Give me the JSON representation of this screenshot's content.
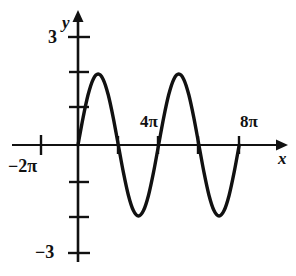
{
  "figure": {
    "type": "math-graph",
    "background": "#ffffff",
    "ink_color": "#111111"
  },
  "labels": {
    "y_axis": "y",
    "x_axis": "x",
    "y_top": "3",
    "y_bottom": "−3",
    "x_left": "−2π",
    "x_mid": "4π",
    "x_right": "8π"
  },
  "chart_data": {
    "type": "line",
    "title": "",
    "xlabel": "x",
    "ylabel": "y",
    "function": "y = 2 sin(x/2)",
    "amplitude": 2,
    "period": "4π",
    "grid": false,
    "legend": null,
    "xlim": [
      "−2π",
      "9π"
    ],
    "ylim": [
      -3,
      3
    ],
    "y_ticks": [
      3,
      2,
      1,
      0,
      -1,
      -2,
      -3
    ],
    "y_tick_labels": [
      "3",
      "",
      "",
      "",
      "",
      "",
      "−3"
    ],
    "x_ticks": [
      "−2π",
      "0",
      "2π",
      "4π",
      "6π",
      "8π"
    ],
    "x_tick_labels": [
      "−2π",
      "",
      "",
      "4π",
      "",
      "8π"
    ],
    "domain_drawn": [
      "0",
      "8π"
    ],
    "zero_crossings": [
      "0",
      "2π",
      "4π",
      "6π",
      "8π"
    ],
    "maxima": [
      {
        "x": "π",
        "y": 2
      },
      {
        "x": "5π",
        "y": 2
      }
    ],
    "minima": [
      {
        "x": "3π",
        "y": -2
      },
      {
        "x": "7π",
        "y": -2
      }
    ],
    "x": [
      0.0,
      0.25,
      0.5,
      0.75,
      1.0,
      1.25,
      1.5,
      1.75,
      2.0,
      2.25,
      2.5,
      2.75,
      3.0,
      3.25,
      3.5,
      3.75,
      4.0,
      4.25,
      4.5,
      4.75,
      5.0,
      5.25,
      5.5,
      5.75,
      6.0,
      6.25,
      6.5,
      6.75,
      7.0,
      7.25,
      7.5,
      7.75,
      8.0
    ],
    "x_unit": "π",
    "values": [
      0.0,
      0.765,
      1.414,
      1.848,
      2.0,
      1.848,
      1.414,
      0.765,
      0.0,
      -0.765,
      -1.414,
      -1.848,
      -2.0,
      -1.848,
      -1.414,
      -0.765,
      0.0,
      0.765,
      1.414,
      1.848,
      2.0,
      1.848,
      1.414,
      0.765,
      0.0,
      -0.765,
      -1.414,
      -1.848,
      -2.0,
      -1.848,
      -1.414,
      -0.765,
      0.0
    ]
  }
}
